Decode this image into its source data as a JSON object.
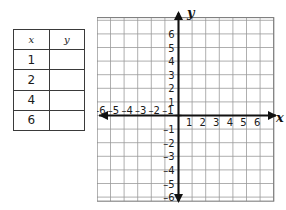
{
  "table": {
    "headers": [
      "x",
      "y"
    ],
    "rows": [
      {
        "x": "1",
        "y": ""
      },
      {
        "x": "2",
        "y": ""
      },
      {
        "x": "4",
        "y": ""
      },
      {
        "x": "6",
        "y": ""
      }
    ]
  },
  "graph": {
    "x_axis_label": "x",
    "y_axis_label": "y",
    "x_tick_labels_negative": [
      "-6",
      "-5",
      "-4",
      "-3",
      "-2",
      "-1"
    ],
    "x_tick_labels_positive": [
      "1",
      "2",
      "3",
      "4",
      "5",
      "6"
    ],
    "y_tick_labels_positive": [
      "6",
      "5",
      "4",
      "3",
      "2",
      "1"
    ],
    "y_tick_labels_negative": [
      "-1",
      "-2",
      "-3",
      "-4",
      "-5",
      "-6"
    ],
    "grid_color": "#9a9a9a",
    "axis_color": "#111111"
  },
  "chart_data": {
    "type": "scatter",
    "title": "",
    "xlabel": "x",
    "ylabel": "y",
    "xlim": [
      -7,
      7
    ],
    "ylim": [
      -7,
      7
    ],
    "xticks": [
      -6,
      -5,
      -4,
      -3,
      -2,
      -1,
      1,
      2,
      3,
      4,
      5,
      6
    ],
    "yticks": [
      -6,
      -5,
      -4,
      -3,
      -2,
      -1,
      1,
      2,
      3,
      4,
      5,
      6
    ],
    "grid": true,
    "legend": "none",
    "series": [
      {
        "name": "plotted points",
        "x": [],
        "y": []
      }
    ],
    "table": {
      "columns": [
        "x",
        "y"
      ],
      "rows": [
        [
          "1",
          ""
        ],
        [
          "2",
          ""
        ],
        [
          "4",
          ""
        ],
        [
          "6",
          ""
        ]
      ]
    }
  }
}
